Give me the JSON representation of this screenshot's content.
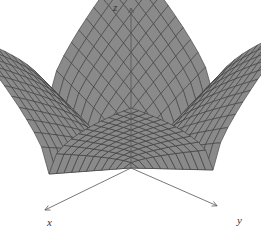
{
  "chart_data": {
    "type": "surface3d",
    "title": "",
    "xlabel": "x",
    "ylabel": "y",
    "zlabel": "z",
    "surface_color": "#8a8a8a",
    "mesh_color": "#3a3a3a",
    "axis_color": "#555555",
    "grid": false,
    "legend": null
  },
  "labels": {
    "x": "x",
    "y": "y",
    "z": "z"
  }
}
